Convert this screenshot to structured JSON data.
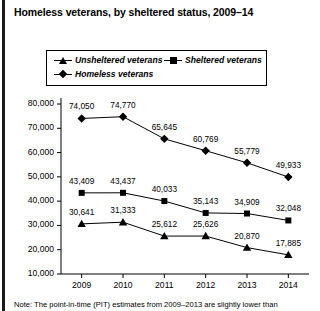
{
  "chart_title": "Homeless veterans, by sheltered status, 2009–14",
  "note": "Note: The point-in-time (PIT) estimates from 2009–2013 are slightly lower than",
  "legend": {
    "unsheltered": "Unsheltered veterans",
    "sheltered": "Sheltered veterans",
    "homeless": "Homeless veterans"
  },
  "chart_data": {
    "type": "line",
    "title": "Homeless veterans, by sheltered status, 2009–14",
    "xlabel": "",
    "ylabel": "",
    "categories": [
      "2009",
      "2010",
      "2011",
      "2012",
      "2013",
      "2014"
    ],
    "x": [
      2009,
      2010,
      2011,
      2012,
      2013,
      2014
    ],
    "ylim": [
      10000,
      80000
    ],
    "yticks": [
      "10,000",
      "20,000",
      "30,000",
      "40,000",
      "50,000",
      "60,000",
      "70,000",
      "80,000"
    ],
    "ytick_values": [
      10000,
      20000,
      30000,
      40000,
      50000,
      60000,
      70000,
      80000
    ],
    "grid": false,
    "legend_position": "top",
    "series": [
      {
        "name": "Homeless veterans",
        "marker": "diamond",
        "values": [
          74050,
          74770,
          65645,
          60769,
          55779,
          49933
        ],
        "labels": [
          "74,050",
          "74,770",
          "65,645",
          "60,769",
          "55,779",
          "49,933"
        ]
      },
      {
        "name": "Sheltered veterans",
        "marker": "square",
        "values": [
          43409,
          43437,
          40033,
          35143,
          34909,
          32048
        ],
        "labels": [
          "43,409",
          "43,437",
          "40,033",
          "35,143",
          "34,909",
          "32,048"
        ]
      },
      {
        "name": "Unsheltered veterans",
        "marker": "triangle",
        "values": [
          30641,
          31333,
          25612,
          25626,
          20870,
          17885
        ],
        "labels": [
          "30,641",
          "31,333",
          "25,612",
          "25,626",
          "20,870",
          "17,885"
        ]
      }
    ]
  }
}
